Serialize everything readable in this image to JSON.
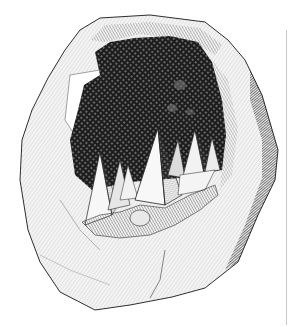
{
  "image": {
    "subject": "Engraving of a split geode with pyramidal crystals inside",
    "alt": "Black-and-white engraving of a geode rock cavity lined with pointed crystals",
    "style": "hatched line engraving",
    "colors": {
      "background": "#ffffff",
      "ink": "#1a1a1a",
      "cavity": "#222222",
      "rock_light": "#f2f2f2",
      "rock_mid": "#bdbdbd",
      "rock_shadow": "#3a3a3a",
      "crystal_face_light": "#f7f7f7",
      "crystal_face_mid": "#cfcfcf",
      "crystal_face_dark": "#7a7a7a",
      "edge_line": "#c8c8c8"
    }
  }
}
